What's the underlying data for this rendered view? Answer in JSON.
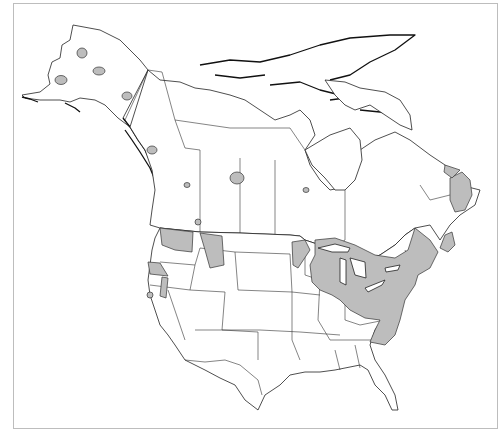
{
  "map": {
    "title": "",
    "region": "North America",
    "colors": {
      "range_fill": "#bdbdbd",
      "land_fill": "#ffffff",
      "outline": "#222222",
      "frame": "#bdbdbd"
    },
    "legend": []
  }
}
